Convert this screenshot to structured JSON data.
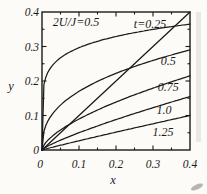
{
  "figure": {
    "annotation": "2U/J=0.5",
    "xlabel": "x",
    "ylabel": "y"
  },
  "chart_data": {
    "type": "line",
    "title": "",
    "xlabel": "x",
    "ylabel": "y",
    "xlim": [
      0,
      0.4
    ],
    "ylim": [
      0,
      0.4
    ],
    "grid": false,
    "annotation": "2U/J=0.5",
    "annotation_pos": [
      0.092,
      0.371
    ],
    "x_tick_labels": [
      "0",
      "0.1",
      "0.2",
      "0.3",
      "0.4"
    ],
    "x_tick_values": [
      0,
      0.1,
      0.2,
      0.3,
      0.4
    ],
    "y_tick_labels": [
      "0",
      "0.1",
      "0.2",
      "0.3",
      "0.4"
    ],
    "y_tick_values": [
      0,
      0.1,
      0.2,
      0.3,
      0.4
    ],
    "minor_tick_step": 0.05,
    "x": [
      0,
      0.05,
      0.1,
      0.15,
      0.2,
      0.25,
      0.3,
      0.35,
      0.4
    ],
    "series": [
      {
        "name": "t=0.25",
        "label": "t=0.25",
        "label_pos": [
          0.292,
          0.365
        ],
        "values": [
          0,
          0.267,
          0.296,
          0.315,
          0.329,
          0.34,
          0.35,
          0.358,
          0.365
        ],
        "fit": {
          "A": 0.365,
          "p": 0.15
        }
      },
      {
        "name": "t=0.5",
        "label": "0.5",
        "label_pos": [
          0.341,
          0.258
        ],
        "values": [
          0,
          0.13,
          0.17,
          0.199,
          0.222,
          0.242,
          0.26,
          0.275,
          0.29
        ],
        "fit": {
          "A": 0.29,
          "p": 0.385
        }
      },
      {
        "name": "t=0.75",
        "label": "0.75",
        "label_pos": [
          0.341,
          0.183
        ],
        "values": [
          0,
          0.058,
          0.09,
          0.116,
          0.139,
          0.16,
          0.179,
          0.198,
          0.215
        ],
        "fit": {
          "A": 0.215,
          "p": 0.63
        }
      },
      {
        "name": "t=1.0",
        "label": "1.0",
        "label_pos": [
          0.33,
          0.116
        ],
        "values": [
          0,
          0.028,
          0.05,
          0.07,
          0.088,
          0.106,
          0.123,
          0.139,
          0.155
        ],
        "fit": {
          "A": 0.155,
          "p": 0.815
        }
      },
      {
        "name": "t=1.25",
        "label": "1.25",
        "label_pos": [
          0.327,
          0.052
        ],
        "values": [
          0,
          0.014,
          0.027,
          0.039,
          0.052,
          0.064,
          0.076,
          0.088,
          0.1
        ],
        "fit": {
          "A": 0.1,
          "p": 0.95
        }
      },
      {
        "name": "reference-diagonal",
        "label": "",
        "points": [
          [
            0,
            0
          ],
          [
            0.4,
            0.4
          ]
        ]
      }
    ],
    "ink_color": "#1a1a1a",
    "background_color": "#fcfbf8"
  }
}
